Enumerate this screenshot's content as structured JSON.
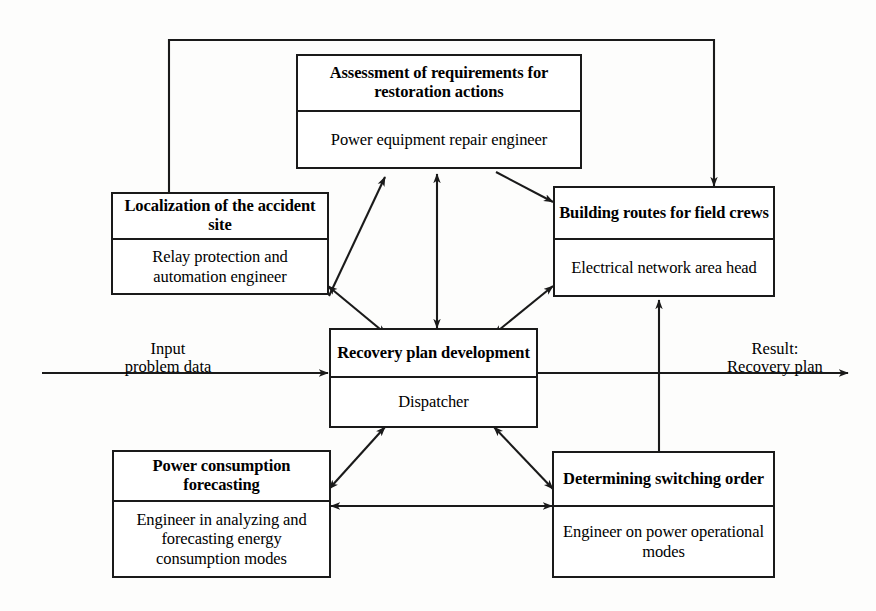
{
  "diagram": {
    "stroke_color": "#1a1a1a",
    "background_color": "#fdfdfc",
    "nodes": [
      {
        "id": "assessment",
        "title": "Assessment of requirements for restoration actions",
        "role": "Power equipment repair engineer"
      },
      {
        "id": "localization",
        "title": "Localization of the accident site",
        "role": "Relay protection and automation engineer"
      },
      {
        "id": "building-routes",
        "title": "Building routes for field crews",
        "role": "Electrical network area head"
      },
      {
        "id": "recovery-plan",
        "title": "Recovery plan development",
        "role": "Dispatcher"
      },
      {
        "id": "power-consumption",
        "title": "Power consumption forecasting",
        "role": "Engineer in analyzing and forecasting energy consumption modes"
      },
      {
        "id": "switching-order",
        "title": "Determining switching order",
        "role": "Engineer on power operational modes"
      }
    ],
    "edge_labels": {
      "input_line1": "Input",
      "input_line2": "problem data",
      "result_line1": "Result:",
      "result_line2": "Recovery plan"
    }
  }
}
